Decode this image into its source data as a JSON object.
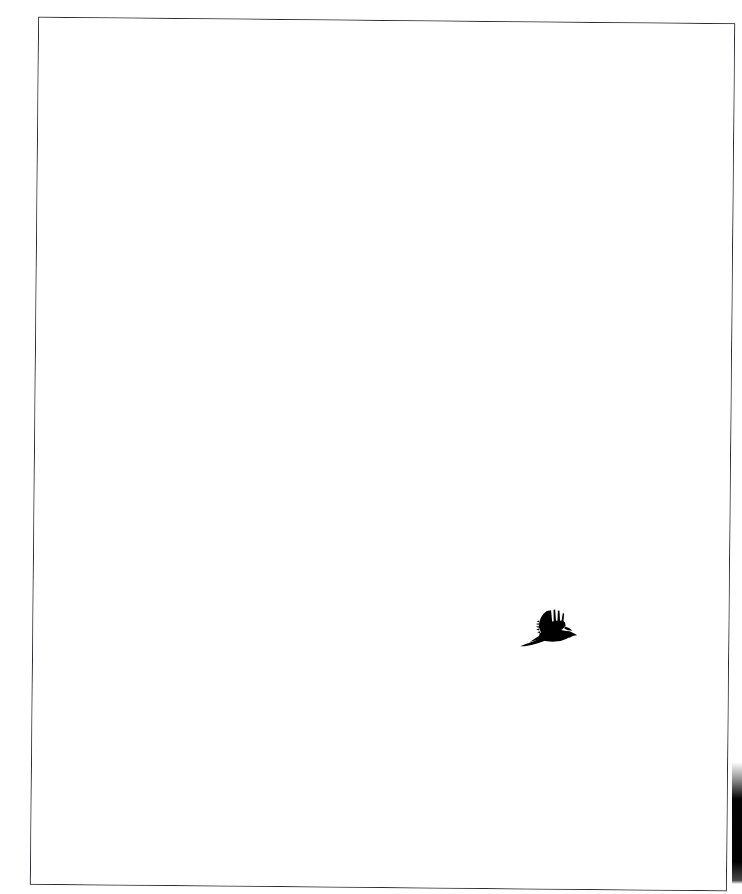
{
  "scene": {
    "width": 742,
    "height": 894,
    "background_color": "#ffffff",
    "description": "Scanned white photographic print showing a single black bird silhouette flying against an empty white sky"
  },
  "photo_frame": {
    "name": "photo-border",
    "border_color": "#2b2b30",
    "border_width_px": 1,
    "fill_color": "#ffffff",
    "rotation_deg": 0.55,
    "left": 34,
    "top": 20,
    "width": 697,
    "height": 868
  },
  "sky": {
    "color": "#ffffff",
    "label": "empty white sky"
  },
  "subject": {
    "name": "bird-silhouette",
    "species_guess": "crow / magpie",
    "color": "#000000",
    "pose": "in flight, wings raised",
    "heading": "right",
    "bounding_box": {
      "x": 519,
      "y": 603,
      "width": 61,
      "height": 48
    },
    "features": [
      "splayed primary feather tips on raised wing",
      "serrated trailing edge of secondary feathers",
      "pointed beak facing right",
      "long tapered tail trailing to lower left"
    ]
  },
  "artifacts": {
    "edge_shadow": {
      "name": "scan-edge-shadow",
      "color": "#020202",
      "position": "right edge, lower portion",
      "top": 762,
      "height": 122,
      "width": 10
    }
  }
}
